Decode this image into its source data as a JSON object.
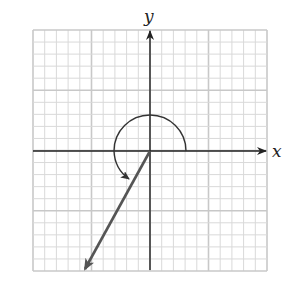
{
  "figure": {
    "type": "coordinate-plane-angle",
    "axes": {
      "x_label": "x",
      "y_label": "y"
    },
    "grid": {
      "cells_x": 20,
      "cells_y": 20,
      "major_every": 5,
      "minor_color": "#d9d9d9",
      "major_color": "#c8c8c8"
    },
    "angle": {
      "initial_side": "positive x-axis",
      "direction": "counterclockwise",
      "terminal_ray_direction": "quadrant III",
      "arc_color": "#333333",
      "ray_color": "#555555"
    },
    "colors": {
      "axis": "#222222",
      "background": "#ffffff"
    }
  }
}
